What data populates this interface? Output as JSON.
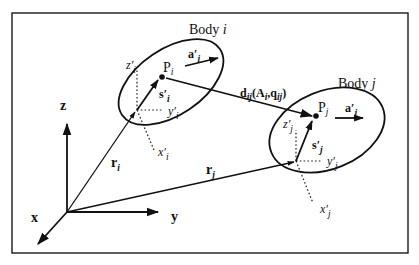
{
  "figure": {
    "type": "multibody-kinematics-diagram",
    "global_frame": {
      "axes": [
        {
          "name": "z",
          "label": "z"
        },
        {
          "name": "y",
          "label": "y"
        },
        {
          "name": "x",
          "label": "x"
        }
      ]
    },
    "bodies": [
      {
        "id": "i",
        "title": "Body",
        "title_index": "i",
        "point": {
          "label": "P",
          "sub": "i"
        },
        "axis_vector": {
          "label": "a′",
          "sub": "i"
        },
        "local_vector": {
          "label": "s′",
          "sub": "i"
        },
        "local_axes": {
          "z": {
            "label": "z′",
            "sub": "i"
          },
          "y": {
            "label": "y′",
            "sub": "i"
          },
          "x": {
            "label": "x′",
            "sub": "i"
          }
        },
        "position_vector": {
          "label": "r",
          "sub": "i"
        }
      },
      {
        "id": "j",
        "title": "Body",
        "title_index": "j",
        "point": {
          "label": "P",
          "sub": "j"
        },
        "axis_vector": {
          "label": "a′",
          "sub": "j"
        },
        "local_vector": {
          "label": "s′",
          "sub": "j"
        },
        "local_axes": {
          "z": {
            "label": "z′",
            "sub": "j"
          },
          "y": {
            "label": "y′",
            "sub": "j"
          },
          "x": {
            "label": "x′",
            "sub": "j"
          }
        },
        "position_vector": {
          "label": "r",
          "sub": "j"
        }
      }
    ],
    "relative_vector": {
      "label": "d",
      "sub": "ij",
      "args_open": "(",
      "arg1": "A",
      "arg1_sub": "i",
      "sep": ",",
      "arg2": "q",
      "arg2_sub": "ij",
      "args_close": ")"
    }
  },
  "colors": {
    "stroke": "#111111",
    "background": "#ffffff"
  }
}
